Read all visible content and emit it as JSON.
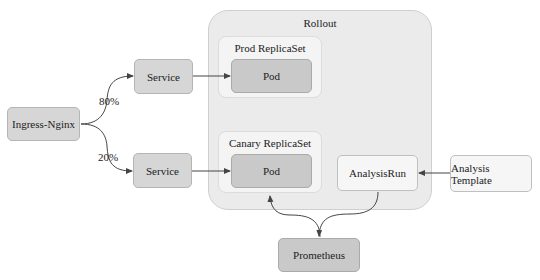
{
  "diagram": {
    "rollout": {
      "label": "Rollout"
    },
    "prod_replicaset": {
      "label": "Prod ReplicaSet",
      "pod_label": "Pod"
    },
    "canary_replicaset": {
      "label": "Canary ReplicaSet",
      "pod_label": "Pod"
    },
    "analysis_run": {
      "label": "AnalysisRun"
    },
    "analysis_template": {
      "label": "Analysis Template"
    },
    "ingress": {
      "label": "Ingress-Nginx"
    },
    "service_prod": {
      "label": "Service"
    },
    "service_canary": {
      "label": "Service"
    },
    "prometheus": {
      "label": "Prometheus"
    },
    "edges": [
      {
        "from": "Ingress-Nginx",
        "to": "Service (prod)",
        "label": "80%"
      },
      {
        "from": "Ingress-Nginx",
        "to": "Service (canary)",
        "label": "20%"
      },
      {
        "from": "Service (prod)",
        "to": "Pod (prod)"
      },
      {
        "from": "Service (canary)",
        "to": "Pod (canary)"
      },
      {
        "from": "Analysis Template",
        "to": "AnalysisRun"
      },
      {
        "from": "Prometheus",
        "to": "Pod (canary)"
      },
      {
        "from": "AnalysisRun",
        "to": "Prometheus"
      }
    ],
    "colors": {
      "rollout_fill": "#ebebeb",
      "replicaset_fill": "#f4f4f4",
      "pod_fill": "#c9c9c9",
      "service_fill": "#d6d6d6",
      "light_fill": "#f6f6f6",
      "edge": "#444444"
    }
  }
}
